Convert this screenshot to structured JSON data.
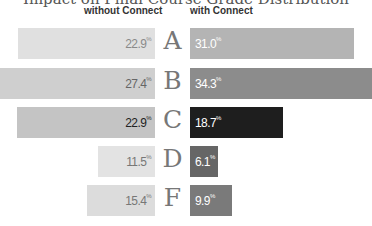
{
  "chart_data": {
    "type": "bar",
    "orientation": "horizontal-butterfly",
    "title": "Impact on Final Course Grade Distribution",
    "categories": [
      "A",
      "B",
      "C",
      "D",
      "F"
    ],
    "series": [
      {
        "name": "without Connect",
        "values": [
          22.9,
          27.4,
          22.9,
          11.5,
          15.4
        ],
        "color": "#d8d8d8"
      },
      {
        "name": "with Connect",
        "values": [
          31.0,
          34.3,
          18.7,
          6.1,
          9.9
        ]
      }
    ],
    "unit": "%",
    "legend_position": "top"
  },
  "title": "Impact on Final Course Grade Distribution",
  "headers": {
    "left": "without Connect",
    "right": "with Connect"
  },
  "rows": [
    {
      "grade": "A",
      "left": "22.9",
      "right": "31.0",
      "left_color": "#e0e0e0",
      "right_color": "#b4b4b4",
      "right_text": "#ffffff",
      "left_text": "#8a8a8a"
    },
    {
      "grade": "B",
      "left": "27.4",
      "right": "34.3",
      "left_color": "#cfcfcf",
      "right_color": "#8c8c8c",
      "right_text": "#ffffff",
      "left_text": "#666666"
    },
    {
      "grade": "C",
      "left": "22.9",
      "right": "18.7",
      "left_color": "#c4c4c4",
      "right_color": "#1e1e1e",
      "right_text": "#ffffff",
      "left_text": "#222222"
    },
    {
      "grade": "D",
      "left": "11.5",
      "right": "6.1",
      "left_color": "#e3e3e3",
      "right_color": "#666666",
      "right_text": "#ffffff",
      "left_text": "#777777"
    },
    {
      "grade": "F",
      "left": "15.4",
      "right": "9.9",
      "left_color": "#dcdcdc",
      "right_color": "#7a7a7a",
      "right_text": "#ffffff",
      "left_text": "#777777"
    }
  ],
  "percent_sign": "%"
}
